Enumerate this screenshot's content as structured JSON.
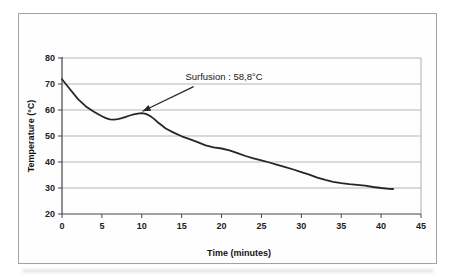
{
  "figure": {
    "background": "#ffffff",
    "frame_color": "#a3a3a3"
  },
  "chart_data": {
    "type": "line",
    "title": "",
    "xlabel": "Time (minutes)",
    "ylabel": "Temperature (°C)",
    "xlim": [
      0,
      45
    ],
    "ylim": [
      20,
      80
    ],
    "xticks": [
      0,
      5,
      10,
      15,
      20,
      25,
      30,
      35,
      40,
      45
    ],
    "yticks": [
      20,
      30,
      40,
      50,
      60,
      70,
      80
    ],
    "grid": "horizontal-only",
    "legend": "none",
    "colors": {
      "curve": "#262626",
      "grid": "#b5b5b5",
      "axis": "#444444",
      "plot_border": "#adadad",
      "text": "#1c1c1c"
    },
    "series": [
      {
        "name": "temperature-cooling-curve",
        "x": [
          0,
          1,
          2,
          3,
          4,
          5,
          5.5,
          6,
          6.5,
          7,
          7.5,
          8,
          8.5,
          9,
          9.5,
          10,
          10.5,
          11,
          11.5,
          12,
          12.5,
          13,
          14,
          15,
          16,
          17,
          18,
          19,
          20,
          21,
          22,
          23,
          24,
          25,
          26,
          27,
          28,
          29,
          30,
          31,
          32,
          33,
          34,
          35,
          36,
          37,
          38,
          39,
          40,
          41,
          41.5
        ],
        "y": [
          71.8,
          68.0,
          64.2,
          61.4,
          59.3,
          57.6,
          56.9,
          56.4,
          56.3,
          56.5,
          56.9,
          57.4,
          57.9,
          58.3,
          58.6,
          58.8,
          58.5,
          57.8,
          56.7,
          55.3,
          54.1,
          52.9,
          51.3,
          49.9,
          48.8,
          47.6,
          46.4,
          45.6,
          45.2,
          44.5,
          43.4,
          42.3,
          41.4,
          40.6,
          39.8,
          38.9,
          38.0,
          37.1,
          36.1,
          35.1,
          34.0,
          33.1,
          32.4,
          31.9,
          31.5,
          31.2,
          30.9,
          30.4,
          30.0,
          29.7,
          29.6
        ]
      }
    ],
    "annotation": {
      "text": "Surfusion : 58,8°C",
      "arrow_from": {
        "x": 16.5,
        "y": 69.0
      },
      "arrow_to": {
        "x": 10.1,
        "y": 59.5
      },
      "label_center": {
        "x": 20.3,
        "y": 73.0
      }
    }
  }
}
